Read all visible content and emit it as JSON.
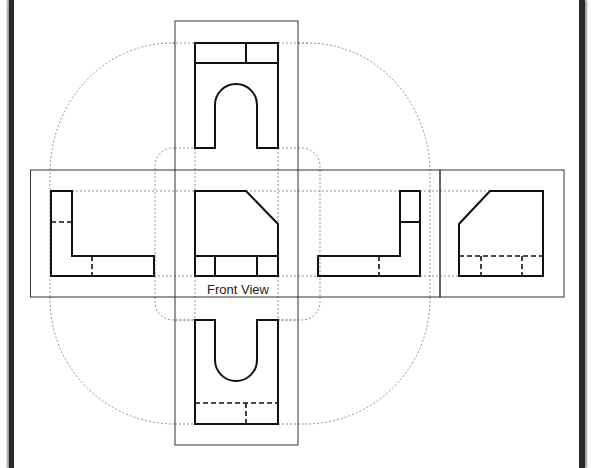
{
  "diagram": {
    "type": "orthographic-projection-unfolded",
    "front_view_label": "Front View",
    "views": [
      {
        "name": "top-view",
        "position": "top"
      },
      {
        "name": "left-side-view",
        "position": "left"
      },
      {
        "name": "front-view",
        "position": "center"
      },
      {
        "name": "right-side-view",
        "position": "right"
      },
      {
        "name": "rear-view",
        "position": "far-right"
      },
      {
        "name": "bottom-view",
        "position": "bottom"
      }
    ],
    "colors": {
      "object_line": "#111111",
      "frame_line": "#333333",
      "projection_line": "#777777",
      "border": "#2a2a2a"
    }
  }
}
